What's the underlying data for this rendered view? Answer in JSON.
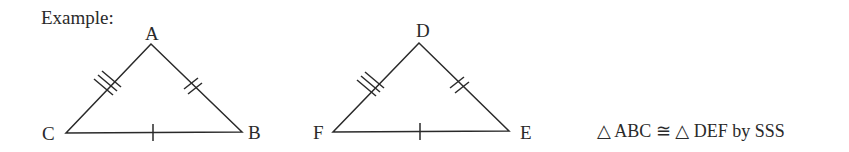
{
  "heading": "Example:",
  "triangle1": {
    "top": "A",
    "left": "C",
    "right": "B"
  },
  "triangle2": {
    "top": "D",
    "left": "F",
    "right": "E"
  },
  "statement": "△ ABC ≅ △ DEF by SSS",
  "colors": {
    "stroke": "#2a2a2a"
  }
}
